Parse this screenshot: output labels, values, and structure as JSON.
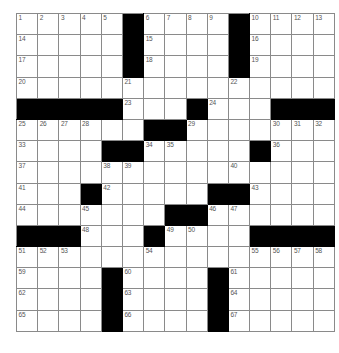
{
  "puzzle": {
    "type": "crossword-grid",
    "rows": 15,
    "columns": 15,
    "colors": {
      "block": "#000000",
      "cell": "#ffffff",
      "gridline": "#8a8a8a",
      "number": "#555555",
      "background": "#ffffff"
    },
    "max_clue_number": 67,
    "grid": [
      [
        {
          "block": false,
          "number": "1"
        },
        {
          "block": false,
          "number": "2"
        },
        {
          "block": false,
          "number": "3"
        },
        {
          "block": false,
          "number": "4"
        },
        {
          "block": false,
          "number": "5"
        },
        {
          "block": true,
          "number": ""
        },
        {
          "block": false,
          "number": "6"
        },
        {
          "block": false,
          "number": "7"
        },
        {
          "block": false,
          "number": "8"
        },
        {
          "block": false,
          "number": "9"
        },
        {
          "block": true,
          "number": ""
        },
        {
          "block": false,
          "number": "10"
        },
        {
          "block": false,
          "number": "11"
        },
        {
          "block": false,
          "number": "12"
        },
        {
          "block": false,
          "number": "13"
        }
      ],
      [
        {
          "block": false,
          "number": "14"
        },
        {
          "block": false,
          "number": ""
        },
        {
          "block": false,
          "number": ""
        },
        {
          "block": false,
          "number": ""
        },
        {
          "block": false,
          "number": ""
        },
        {
          "block": true,
          "number": ""
        },
        {
          "block": false,
          "number": "15"
        },
        {
          "block": false,
          "number": ""
        },
        {
          "block": false,
          "number": ""
        },
        {
          "block": false,
          "number": ""
        },
        {
          "block": true,
          "number": ""
        },
        {
          "block": false,
          "number": "16"
        },
        {
          "block": false,
          "number": ""
        },
        {
          "block": false,
          "number": ""
        },
        {
          "block": false,
          "number": ""
        }
      ],
      [
        {
          "block": false,
          "number": "17"
        },
        {
          "block": false,
          "number": ""
        },
        {
          "block": false,
          "number": ""
        },
        {
          "block": false,
          "number": ""
        },
        {
          "block": false,
          "number": ""
        },
        {
          "block": true,
          "number": ""
        },
        {
          "block": false,
          "number": "18"
        },
        {
          "block": false,
          "number": ""
        },
        {
          "block": false,
          "number": ""
        },
        {
          "block": false,
          "number": ""
        },
        {
          "block": true,
          "number": ""
        },
        {
          "block": false,
          "number": "19"
        },
        {
          "block": false,
          "number": ""
        },
        {
          "block": false,
          "number": ""
        },
        {
          "block": false,
          "number": ""
        }
      ],
      [
        {
          "block": false,
          "number": "20"
        },
        {
          "block": false,
          "number": ""
        },
        {
          "block": false,
          "number": ""
        },
        {
          "block": false,
          "number": ""
        },
        {
          "block": false,
          "number": ""
        },
        {
          "block": false,
          "number": "21"
        },
        {
          "block": false,
          "number": ""
        },
        {
          "block": false,
          "number": ""
        },
        {
          "block": false,
          "number": ""
        },
        {
          "block": false,
          "number": ""
        },
        {
          "block": false,
          "number": "22"
        },
        {
          "block": false,
          "number": ""
        },
        {
          "block": false,
          "number": ""
        },
        {
          "block": false,
          "number": ""
        },
        {
          "block": false,
          "number": ""
        }
      ],
      [
        {
          "block": true,
          "number": ""
        },
        {
          "block": true,
          "number": ""
        },
        {
          "block": true,
          "number": ""
        },
        {
          "block": true,
          "number": ""
        },
        {
          "block": true,
          "number": ""
        },
        {
          "block": false,
          "number": "23"
        },
        {
          "block": false,
          "number": ""
        },
        {
          "block": false,
          "number": ""
        },
        {
          "block": true,
          "number": ""
        },
        {
          "block": false,
          "number": "24"
        },
        {
          "block": false,
          "number": ""
        },
        {
          "block": false,
          "number": ""
        },
        {
          "block": true,
          "number": ""
        },
        {
          "block": true,
          "number": ""
        },
        {
          "block": true,
          "number": ""
        }
      ],
      [
        {
          "block": false,
          "number": "25"
        },
        {
          "block": false,
          "number": "26"
        },
        {
          "block": false,
          "number": "27"
        },
        {
          "block": false,
          "number": "28"
        },
        {
          "block": false,
          "number": ""
        },
        {
          "block": false,
          "number": ""
        },
        {
          "block": true,
          "number": ""
        },
        {
          "block": true,
          "number": ""
        },
        {
          "block": false,
          "number": "29"
        },
        {
          "block": false,
          "number": ""
        },
        {
          "block": false,
          "number": ""
        },
        {
          "block": false,
          "number": ""
        },
        {
          "block": false,
          "number": "30"
        },
        {
          "block": false,
          "number": "31"
        },
        {
          "block": false,
          "number": "32"
        }
      ],
      [
        {
          "block": false,
          "number": "33"
        },
        {
          "block": false,
          "number": ""
        },
        {
          "block": false,
          "number": ""
        },
        {
          "block": false,
          "number": ""
        },
        {
          "block": true,
          "number": ""
        },
        {
          "block": true,
          "number": ""
        },
        {
          "block": false,
          "number": "34"
        },
        {
          "block": false,
          "number": "35"
        },
        {
          "block": false,
          "number": ""
        },
        {
          "block": false,
          "number": ""
        },
        {
          "block": false,
          "number": ""
        },
        {
          "block": true,
          "number": ""
        },
        {
          "block": false,
          "number": "36"
        },
        {
          "block": false,
          "number": ""
        },
        {
          "block": false,
          "number": ""
        }
      ],
      [
        {
          "block": false,
          "number": "37"
        },
        {
          "block": false,
          "number": ""
        },
        {
          "block": false,
          "number": ""
        },
        {
          "block": false,
          "number": ""
        },
        {
          "block": false,
          "number": "38"
        },
        {
          "block": false,
          "number": "39"
        },
        {
          "block": false,
          "number": ""
        },
        {
          "block": false,
          "number": ""
        },
        {
          "block": false,
          "number": ""
        },
        {
          "block": false,
          "number": ""
        },
        {
          "block": false,
          "number": "40"
        },
        {
          "block": false,
          "number": ""
        },
        {
          "block": false,
          "number": ""
        },
        {
          "block": false,
          "number": ""
        },
        {
          "block": false,
          "number": ""
        }
      ],
      [
        {
          "block": false,
          "number": "41"
        },
        {
          "block": false,
          "number": ""
        },
        {
          "block": false,
          "number": ""
        },
        {
          "block": true,
          "number": ""
        },
        {
          "block": false,
          "number": "42"
        },
        {
          "block": false,
          "number": ""
        },
        {
          "block": false,
          "number": ""
        },
        {
          "block": false,
          "number": ""
        },
        {
          "block": false,
          "number": ""
        },
        {
          "block": true,
          "number": ""
        },
        {
          "block": true,
          "number": ""
        },
        {
          "block": false,
          "number": "43"
        },
        {
          "block": false,
          "number": ""
        },
        {
          "block": false,
          "number": ""
        },
        {
          "block": false,
          "number": ""
        }
      ],
      [
        {
          "block": false,
          "number": "44"
        },
        {
          "block": false,
          "number": ""
        },
        {
          "block": false,
          "number": ""
        },
        {
          "block": false,
          "number": "45"
        },
        {
          "block": false,
          "number": ""
        },
        {
          "block": false,
          "number": ""
        },
        {
          "block": false,
          "number": ""
        },
        {
          "block": true,
          "number": ""
        },
        {
          "block": true,
          "number": ""
        },
        {
          "block": false,
          "number": "46"
        },
        {
          "block": false,
          "number": "47"
        },
        {
          "block": false,
          "number": ""
        },
        {
          "block": false,
          "number": ""
        },
        {
          "block": false,
          "number": ""
        },
        {
          "block": false,
          "number": ""
        }
      ],
      [
        {
          "block": true,
          "number": ""
        },
        {
          "block": true,
          "number": ""
        },
        {
          "block": true,
          "number": ""
        },
        {
          "block": false,
          "number": "48"
        },
        {
          "block": false,
          "number": ""
        },
        {
          "block": false,
          "number": ""
        },
        {
          "block": true,
          "number": ""
        },
        {
          "block": false,
          "number": "49"
        },
        {
          "block": false,
          "number": "50"
        },
        {
          "block": false,
          "number": ""
        },
        {
          "block": false,
          "number": ""
        },
        {
          "block": true,
          "number": ""
        },
        {
          "block": true,
          "number": ""
        },
        {
          "block": true,
          "number": ""
        },
        {
          "block": true,
          "number": ""
        }
      ],
      [
        {
          "block": false,
          "number": "51"
        },
        {
          "block": false,
          "number": "52"
        },
        {
          "block": false,
          "number": "53"
        },
        {
          "block": false,
          "number": ""
        },
        {
          "block": false,
          "number": ""
        },
        {
          "block": false,
          "number": ""
        },
        {
          "block": false,
          "number": "54"
        },
        {
          "block": false,
          "number": ""
        },
        {
          "block": false,
          "number": ""
        },
        {
          "block": false,
          "number": ""
        },
        {
          "block": false,
          "number": ""
        },
        {
          "block": false,
          "number": "55"
        },
        {
          "block": false,
          "number": "56"
        },
        {
          "block": false,
          "number": "57"
        },
        {
          "block": false,
          "number": "58"
        }
      ],
      [
        {
          "block": false,
          "number": "59"
        },
        {
          "block": false,
          "number": ""
        },
        {
          "block": false,
          "number": ""
        },
        {
          "block": false,
          "number": ""
        },
        {
          "block": true,
          "number": ""
        },
        {
          "block": false,
          "number": "60"
        },
        {
          "block": false,
          "number": ""
        },
        {
          "block": false,
          "number": ""
        },
        {
          "block": false,
          "number": ""
        },
        {
          "block": true,
          "number": ""
        },
        {
          "block": false,
          "number": "61"
        },
        {
          "block": false,
          "number": ""
        },
        {
          "block": false,
          "number": ""
        },
        {
          "block": false,
          "number": ""
        },
        {
          "block": false,
          "number": ""
        }
      ],
      [
        {
          "block": false,
          "number": "62"
        },
        {
          "block": false,
          "number": ""
        },
        {
          "block": false,
          "number": ""
        },
        {
          "block": false,
          "number": ""
        },
        {
          "block": true,
          "number": ""
        },
        {
          "block": false,
          "number": "63"
        },
        {
          "block": false,
          "number": ""
        },
        {
          "block": false,
          "number": ""
        },
        {
          "block": false,
          "number": ""
        },
        {
          "block": true,
          "number": ""
        },
        {
          "block": false,
          "number": "64"
        },
        {
          "block": false,
          "number": ""
        },
        {
          "block": false,
          "number": ""
        },
        {
          "block": false,
          "number": ""
        },
        {
          "block": false,
          "number": ""
        }
      ],
      [
        {
          "block": false,
          "number": "65"
        },
        {
          "block": false,
          "number": ""
        },
        {
          "block": false,
          "number": ""
        },
        {
          "block": false,
          "number": ""
        },
        {
          "block": true,
          "number": ""
        },
        {
          "block": false,
          "number": "66"
        },
        {
          "block": false,
          "number": ""
        },
        {
          "block": false,
          "number": ""
        },
        {
          "block": false,
          "number": ""
        },
        {
          "block": true,
          "number": ""
        },
        {
          "block": false,
          "number": "67"
        },
        {
          "block": false,
          "number": ""
        },
        {
          "block": false,
          "number": ""
        },
        {
          "block": false,
          "number": ""
        },
        {
          "block": false,
          "number": ""
        }
      ]
    ]
  }
}
